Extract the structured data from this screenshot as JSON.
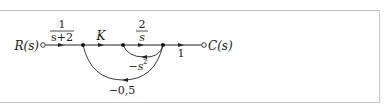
{
  "diagram": {
    "type": "signal-flow-graph",
    "input_label": "R(s)",
    "output_label": "C(s)",
    "nodes": [
      {
        "id": "R",
        "x": 43,
        "kind": "source"
      },
      {
        "id": "n1",
        "x": 83,
        "kind": "junction"
      },
      {
        "id": "n2",
        "x": 123,
        "kind": "junction"
      },
      {
        "id": "n3",
        "x": 163,
        "kind": "junction"
      },
      {
        "id": "C",
        "x": 204,
        "kind": "sink"
      }
    ],
    "forward_branches": [
      {
        "from": "R",
        "to": "n1",
        "gain_numerator": "1",
        "gain_denominator": "s+2"
      },
      {
        "from": "n1",
        "to": "n2",
        "gain": "K"
      },
      {
        "from": "n2",
        "to": "n3",
        "gain_numerator": "2",
        "gain_denominator": "s"
      },
      {
        "from": "n3",
        "to": "C",
        "gain": "1"
      }
    ],
    "feedback_branches": [
      {
        "from": "n3",
        "to": "n2",
        "gain": "−s",
        "gain_exponent": "2"
      },
      {
        "from": "n3",
        "to": "n1",
        "gain": "−0,5"
      }
    ]
  },
  "colors": {
    "line": "#222222",
    "frame": "#c4c4c4"
  }
}
